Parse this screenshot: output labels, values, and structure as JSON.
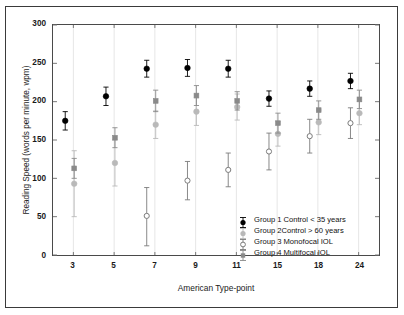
{
  "chart_data": {
    "type": "scatter",
    "title": "",
    "xlabel": "American Type-point",
    "ylabel": "Reading Speed (words per minute, wpm)",
    "categories": [
      "3",
      "5",
      "7",
      "9",
      "11",
      "15",
      "18",
      "24"
    ],
    "x": [
      3,
      5,
      7,
      9,
      11,
      15,
      18,
      24
    ],
    "ylim": [
      0,
      300
    ],
    "yticks": [
      0,
      50,
      100,
      150,
      200,
      250,
      300
    ],
    "grid": true,
    "grid_axis": "x",
    "legend_position": "lower-right",
    "error_bars": "symmetric vertical",
    "series": [
      {
        "name": "Group 1 Control < 35 years",
        "marker": "filled-circle",
        "color": "#000000",
        "values": [
          175,
          207,
          243,
          244,
          243,
          204,
          217,
          227
        ],
        "err_low": [
          12,
          12,
          11,
          11,
          11,
          10,
          10,
          10
        ],
        "err_high": [
          12,
          12,
          11,
          11,
          11,
          10,
          10,
          10
        ]
      },
      {
        "name": "Group 2Control > 60 years",
        "marker": "filled-circle-light",
        "color": "#b9b9b9",
        "values": [
          93,
          120,
          170,
          187,
          193,
          158,
          173,
          185
        ],
        "err_low": [
          43,
          30,
          18,
          18,
          17,
          16,
          16,
          15
        ],
        "err_high": [
          43,
          30,
          18,
          18,
          17,
          16,
          16,
          15
        ]
      },
      {
        "name": "Group 3 Monofocal IOL",
        "marker": "open-circle",
        "color": "#7a7a7a",
        "values": [
          null,
          null,
          51,
          97,
          111,
          135,
          155,
          172
        ],
        "err_low": [
          null,
          null,
          39,
          25,
          22,
          24,
          22,
          20
        ],
        "err_high": [
          null,
          null,
          37,
          25,
          22,
          24,
          22,
          20
        ]
      },
      {
        "name": "Group 4 Multifocal IOL",
        "marker": "filled-square",
        "color": "#8a8a8a",
        "values": [
          113,
          153,
          201,
          208,
          201,
          172,
          189,
          203
        ],
        "err_low": [
          13,
          13,
          14,
          13,
          12,
          13,
          12,
          12
        ],
        "err_high": [
          13,
          13,
          14,
          13,
          12,
          13,
          12,
          12
        ]
      }
    ]
  },
  "axis": {
    "ylabel": "Reading Speed (words per minute, wpm)",
    "xlabel": "American Type-point",
    "ytick_labels": [
      "0",
      "50",
      "100",
      "150",
      "200",
      "250",
      "300"
    ],
    "xtick_labels": [
      "3",
      "5",
      "7",
      "9",
      "11",
      "15",
      "18",
      "24"
    ]
  },
  "legend": {
    "items": [
      {
        "label": "Group 1 Control < 35 years",
        "marker": "filled-circle",
        "color": "#000000"
      },
      {
        "label": "Group 2Control > 60 years",
        "marker": "filled-circle-light",
        "color": "#b9b9b9"
      },
      {
        "label": "Group 3 Monofocal IOL",
        "marker": "open-circle",
        "color": "#7a7a7a"
      },
      {
        "label": "Group 4 Multifocal IOL",
        "marker": "filled-square",
        "color": "#8a8a8a"
      }
    ]
  }
}
